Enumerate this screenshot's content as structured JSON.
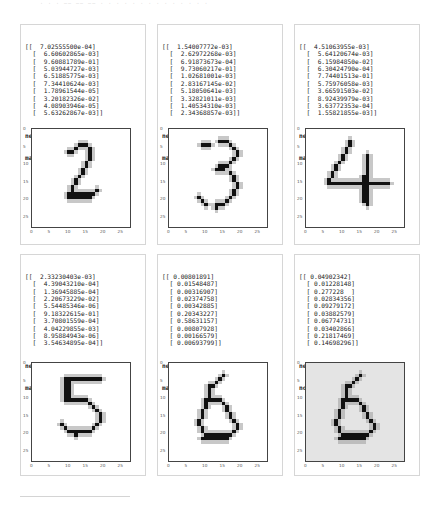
{
  "header_faint_text": "· · ·  —— —— ——  · · · ·  · · · · · · ·  · · ·",
  "panels": [
    {
      "output_lines": [
        "[[  7.02555500e-04]",
        "  [  6.60602865e-03]",
        "  [  9.60881789e-01]",
        "  [  5.03944727e-03]",
        "  [  6.51885775e-03]",
        "  [  7.34410624e-03]",
        "  [  1.78961544e-05]",
        "  [  3.20182326e-02]",
        "  [  4.08903946e-05]",
        "  [  5.63262867e-03]]"
      ],
      "network_says": "network says  2",
      "result": "match!",
      "digit": 2,
      "background": "#ffffff"
    },
    {
      "output_lines": [
        "[[  1.54007772e-03]",
        "  [  2.62972268e-03]",
        "  [  6.91873673e-04]",
        "  [  9.73060217e-01]",
        "  [  1.02681001e-03]",
        "  [  2.83167145e-02]",
        "  [  5.18050641e-03]",
        "  [  3.32821011e-03]",
        "  [  1.40534310e-03]",
        "  [  2.34368857e-03]]"
      ],
      "network_says": "network says  3",
      "result": "match!",
      "digit": 3,
      "background": "#ffffff"
    },
    {
      "output_lines": [
        "[[  4.51063955e-03]",
        "  [  5.64120674e-03]",
        "  [  6.15984850e-02]",
        "  [  6.30424790e-04]",
        "  [  7.74401513e-01]",
        "  [  5.75976058e-03]",
        "  [  3.66591503e-02]",
        "  [  8.92439979e-03]",
        "  [  3.63772353e-04]",
        "  [  1.55821855e-03]]"
      ],
      "network_says": "network says  4",
      "result": "match!",
      "digit": 4,
      "background": "#ffffff"
    },
    {
      "output_lines": [
        "[[  2.33230403e-03]",
        "  [  4.39043210e-04]",
        "  [  1.36945885e-04]",
        "  [  2.20673229e-02]",
        "  [  5.54485346e-06]",
        "  [  9.18322615e-01]",
        "  [  3.70801559e-04]",
        "  [  4.04229855e-03]",
        "  [  8.95884943e-06]",
        "  [  3.54634895e-04]]"
      ],
      "network_says": "network says  5",
      "result": "match!",
      "digit": 5,
      "background": "#ffffff"
    },
    {
      "output_lines": [
        "[[ 0.00801891]",
        "  [ 0.01548487]",
        "  [ 0.00316907]",
        "  [ 0.02374758]",
        "  [ 0.00342885]",
        "  [ 0.20343227]",
        "  [ 0.58631157]",
        "  [ 0.00807928]",
        "  [ 0.00166579]",
        "  [ 0.00693799]]"
      ],
      "network_says": "network says  6",
      "result": "match!",
      "digit": 6,
      "background": "#ffffff"
    },
    {
      "output_lines": [
        "[[ 0.04902342]",
        "  [ 0.01228148]",
        "  [ 0.277228  ]",
        "  [ 0.02834356]",
        "  [ 0.09279172]",
        "  [ 0.03882579]",
        "  [ 0.06774731]",
        "  [ 0.03402866]",
        "  [ 0.21817469]",
        "  [ 0.14698296]]"
      ],
      "network_says": "network says  2",
      "result": "no match!",
      "digit": 6,
      "background": "#e4e4e4"
    }
  ],
  "axes": {
    "y_ticks": [
      "0",
      "5",
      "10",
      "15",
      "20",
      "25"
    ],
    "x_ticks": [
      "0",
      "5",
      "10",
      "15",
      "20",
      "25"
    ]
  },
  "strokes": {
    "2": [
      [
        4,
        13
      ],
      [
        4,
        14
      ],
      [
        4,
        15
      ],
      [
        5,
        12
      ],
      [
        5,
        16
      ],
      [
        6,
        10
      ],
      [
        6,
        11
      ],
      [
        6,
        16
      ],
      [
        7,
        16
      ],
      [
        8,
        16
      ],
      [
        9,
        15
      ],
      [
        10,
        15
      ],
      [
        11,
        14
      ],
      [
        12,
        14
      ],
      [
        13,
        13
      ],
      [
        14,
        12
      ],
      [
        15,
        12
      ],
      [
        16,
        11
      ],
      [
        17,
        11
      ],
      [
        17,
        18
      ],
      [
        18,
        10
      ],
      [
        18,
        11
      ],
      [
        18,
        12
      ],
      [
        18,
        13
      ],
      [
        18,
        14
      ],
      [
        18,
        15
      ],
      [
        18,
        16
      ],
      [
        18,
        17
      ],
      [
        19,
        10
      ],
      [
        19,
        11
      ],
      [
        19,
        12
      ],
      [
        19,
        13
      ],
      [
        19,
        14
      ],
      [
        19,
        15
      ],
      [
        19,
        16
      ]
    ],
    "3": [
      [
        3,
        14
      ],
      [
        3,
        15
      ],
      [
        3,
        16
      ],
      [
        4,
        9
      ],
      [
        4,
        10
      ],
      [
        4,
        11
      ],
      [
        4,
        17
      ],
      [
        5,
        18
      ],
      [
        6,
        19
      ],
      [
        7,
        19
      ],
      [
        8,
        18
      ],
      [
        9,
        17
      ],
      [
        10,
        14
      ],
      [
        10,
        15
      ],
      [
        10,
        16
      ],
      [
        11,
        13
      ],
      [
        11,
        14
      ],
      [
        11,
        15
      ],
      [
        12,
        17
      ],
      [
        13,
        18
      ],
      [
        14,
        18
      ],
      [
        15,
        19
      ],
      [
        16,
        19
      ],
      [
        17,
        18
      ],
      [
        18,
        18
      ],
      [
        19,
        8
      ],
      [
        19,
        17
      ],
      [
        20,
        9
      ],
      [
        20,
        16
      ],
      [
        21,
        10
      ],
      [
        21,
        13
      ],
      [
        21,
        14
      ],
      [
        21,
        15
      ],
      [
        22,
        13
      ]
    ],
    "4": [
      [
        3,
        12
      ],
      [
        4,
        12
      ],
      [
        5,
        11
      ],
      [
        6,
        11
      ],
      [
        7,
        10
      ],
      [
        7,
        17
      ],
      [
        8,
        10
      ],
      [
        8,
        17
      ],
      [
        9,
        9
      ],
      [
        9,
        17
      ],
      [
        10,
        8
      ],
      [
        10,
        17
      ],
      [
        11,
        8
      ],
      [
        11,
        17
      ],
      [
        12,
        7
      ],
      [
        12,
        17
      ],
      [
        13,
        7
      ],
      [
        13,
        16
      ],
      [
        13,
        17
      ],
      [
        14,
        6
      ],
      [
        14,
        16
      ],
      [
        14,
        17
      ],
      [
        15,
        6
      ],
      [
        15,
        7
      ],
      [
        15,
        8
      ],
      [
        15,
        9
      ],
      [
        15,
        10
      ],
      [
        15,
        11
      ],
      [
        15,
        12
      ],
      [
        15,
        13
      ],
      [
        15,
        14
      ],
      [
        15,
        15
      ],
      [
        15,
        16
      ],
      [
        15,
        17
      ],
      [
        15,
        18
      ],
      [
        15,
        19
      ],
      [
        15,
        20
      ],
      [
        15,
        21
      ],
      [
        15,
        22
      ],
      [
        15,
        23
      ],
      [
        16,
        16
      ],
      [
        16,
        17
      ],
      [
        17,
        16
      ],
      [
        17,
        17
      ],
      [
        18,
        16
      ],
      [
        18,
        17
      ],
      [
        19,
        16
      ],
      [
        19,
        17
      ],
      [
        20,
        16
      ],
      [
        20,
        17
      ],
      [
        21,
        17
      ]
    ],
    "5": [
      [
        4,
        9
      ],
      [
        4,
        10
      ],
      [
        4,
        11
      ],
      [
        4,
        12
      ],
      [
        4,
        13
      ],
      [
        4,
        14
      ],
      [
        4,
        15
      ],
      [
        4,
        16
      ],
      [
        4,
        17
      ],
      [
        4,
        18
      ],
      [
        4,
        19
      ],
      [
        5,
        9
      ],
      [
        5,
        10
      ],
      [
        6,
        9
      ],
      [
        6,
        10
      ],
      [
        7,
        9
      ],
      [
        7,
        10
      ],
      [
        8,
        9
      ],
      [
        8,
        10
      ],
      [
        9,
        9
      ],
      [
        9,
        10
      ],
      [
        10,
        9
      ],
      [
        10,
        10
      ],
      [
        10,
        11
      ],
      [
        10,
        12
      ],
      [
        10,
        13
      ],
      [
        10,
        14
      ],
      [
        10,
        15
      ],
      [
        11,
        16
      ],
      [
        12,
        17
      ],
      [
        13,
        18
      ],
      [
        14,
        19
      ],
      [
        15,
        19
      ],
      [
        16,
        19
      ],
      [
        17,
        8
      ],
      [
        17,
        18
      ],
      [
        18,
        9
      ],
      [
        18,
        17
      ],
      [
        19,
        10
      ],
      [
        19,
        11
      ],
      [
        19,
        12
      ],
      [
        19,
        13
      ],
      [
        19,
        14
      ],
      [
        19,
        15
      ],
      [
        19,
        16
      ],
      [
        20,
        12
      ]
    ],
    "6": [
      [
        3,
        15
      ],
      [
        4,
        14
      ],
      [
        5,
        13
      ],
      [
        6,
        12
      ],
      [
        6,
        11
      ],
      [
        7,
        11
      ],
      [
        8,
        11
      ],
      [
        9,
        11
      ],
      [
        10,
        10
      ],
      [
        10,
        11
      ],
      [
        10,
        12
      ],
      [
        10,
        13
      ],
      [
        10,
        14
      ],
      [
        11,
        10
      ],
      [
        11,
        15
      ],
      [
        12,
        10
      ],
      [
        12,
        16
      ],
      [
        13,
        9
      ],
      [
        13,
        16
      ],
      [
        14,
        9
      ],
      [
        14,
        17
      ],
      [
        15,
        9
      ],
      [
        15,
        17
      ],
      [
        16,
        8
      ],
      [
        16,
        18
      ],
      [
        17,
        8
      ],
      [
        17,
        19
      ],
      [
        18,
        9
      ],
      [
        18,
        19
      ],
      [
        19,
        9
      ],
      [
        19,
        18
      ],
      [
        20,
        10
      ],
      [
        20,
        11
      ],
      [
        20,
        12
      ],
      [
        20,
        13
      ],
      [
        20,
        14
      ],
      [
        20,
        15
      ],
      [
        20,
        16
      ],
      [
        20,
        17
      ],
      [
        21,
        9
      ],
      [
        21,
        10
      ],
      [
        21,
        11
      ],
      [
        21,
        12
      ],
      [
        21,
        13
      ],
      [
        21,
        14
      ],
      [
        21,
        15
      ],
      [
        21,
        16
      ]
    ]
  }
}
